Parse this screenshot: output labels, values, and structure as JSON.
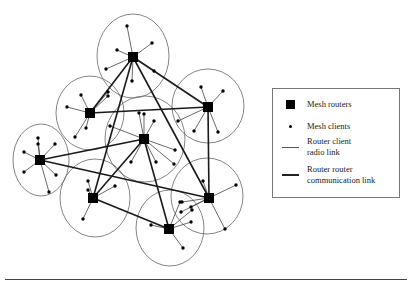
{
  "legend": {
    "items": [
      {
        "symbol": "mesh-router",
        "label": "Mesh routers"
      },
      {
        "symbol": "mesh-client",
        "label": "Mesh clients"
      },
      {
        "symbol": "thin-line",
        "label": "Router client radio link"
      },
      {
        "symbol": "thick-line",
        "label": "Router router communication link"
      }
    ],
    "labels": {
      "routers": "Mesh routers",
      "clients": "Mesh clients",
      "radio_link_1": "Router client",
      "radio_link_2": "radio link",
      "comm_link_1": "Router router",
      "comm_link_2": "communication link"
    }
  },
  "colors": {
    "router": "#000000",
    "client": "#000000",
    "coverage_circle": "#666666",
    "radio_link": "#444444",
    "communication_link": "#1a1a1a",
    "background": "#ffffff"
  },
  "diagram": {
    "routers": [
      {
        "id": "R1",
        "x": 133,
        "y": 57,
        "rx": 36,
        "ry": 42,
        "cx": 133,
        "cy": 56,
        "clients": [
          [
            127,
            26
          ],
          [
            152,
            43
          ],
          [
            117,
            50
          ],
          [
            106,
            69
          ],
          [
            154,
            71
          ],
          [
            132,
            81
          ]
        ]
      },
      {
        "id": "R2",
        "x": 90,
        "y": 113,
        "rx": 34,
        "ry": 37,
        "cx": 90,
        "cy": 113,
        "clients": [
          [
            81,
            95
          ],
          [
            67,
            107
          ],
          [
            108,
            92
          ],
          [
            75,
            137
          ],
          [
            86,
            128
          ],
          [
            108,
            96
          ]
        ]
      },
      {
        "id": "R3",
        "x": 208,
        "y": 107,
        "rx": 36,
        "ry": 37,
        "cx": 208,
        "cy": 106,
        "clients": [
          [
            201,
            87
          ],
          [
            223,
            91
          ],
          [
            194,
            131
          ],
          [
            218,
            132
          ],
          [
            178,
            121
          ]
        ]
      },
      {
        "id": "R4",
        "x": 144,
        "y": 139,
        "rx": 40,
        "ry": 43,
        "cx": 145,
        "cy": 139,
        "clients": [
          [
            139,
            113
          ],
          [
            154,
            121
          ],
          [
            110,
            126
          ],
          [
            175,
            150
          ],
          [
            131,
            162
          ],
          [
            156,
            162
          ],
          [
            174,
            164
          ],
          [
            144,
            114
          ]
        ]
      },
      {
        "id": "R5",
        "x": 40,
        "y": 160,
        "rx": 28,
        "ry": 36,
        "cx": 41,
        "cy": 160,
        "clients": [
          [
            38,
            138
          ],
          [
            55,
            144
          ],
          [
            24,
            152
          ],
          [
            24,
            172
          ],
          [
            56,
            175
          ],
          [
            49,
            192
          ],
          [
            38,
            144
          ]
        ]
      },
      {
        "id": "R6",
        "x": 93,
        "y": 198,
        "rx": 35,
        "ry": 39,
        "cx": 95,
        "cy": 198,
        "clients": [
          [
            88,
            181
          ],
          [
            115,
            186
          ],
          [
            83,
            219
          ],
          [
            88,
            190
          ]
        ]
      },
      {
        "id": "R7",
        "x": 209,
        "y": 198,
        "rx": 36,
        "ry": 38,
        "cx": 207,
        "cy": 196,
        "clients": [
          [
            203,
            181
          ],
          [
            236,
            185
          ],
          [
            182,
            202
          ],
          [
            191,
            207
          ],
          [
            225,
            229
          ],
          [
            181,
            212
          ]
        ]
      },
      {
        "id": "R8",
        "x": 169,
        "y": 229,
        "rx": 34,
        "ry": 38,
        "cx": 170,
        "cy": 228,
        "clients": [
          [
            151,
            225
          ],
          [
            183,
            248
          ],
          [
            191,
            222
          ],
          [
            192,
            210
          ],
          [
            180,
            202
          ]
        ]
      }
    ],
    "communication_links": [
      [
        "R1",
        "R2"
      ],
      [
        "R1",
        "R6"
      ],
      [
        "R1",
        "R7"
      ],
      [
        "R1",
        "R3"
      ],
      [
        "R2",
        "R3"
      ],
      [
        "R3",
        "R7"
      ],
      [
        "R5",
        "R4"
      ],
      [
        "R5",
        "R7"
      ],
      [
        "R4",
        "R6"
      ],
      [
        "R4",
        "R8"
      ],
      [
        "R6",
        "R8"
      ]
    ]
  }
}
